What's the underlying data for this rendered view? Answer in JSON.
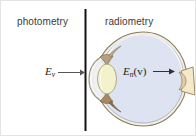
{
  "figure": {
    "width": 196,
    "height": 136,
    "background_color": "#ffffff",
    "border_color": "#e3e3e3"
  },
  "divider": {
    "name": "vertical-divider-line",
    "color": "#111111",
    "x": 84,
    "y_top": 8,
    "y_bottom": 130,
    "thickness": 2
  },
  "labels": {
    "left_side": "photometry",
    "right_side": "radiometry",
    "text_color": "#3b3b3b"
  },
  "quantities": {
    "illuminance": {
      "symbol": "E",
      "subscript": "v",
      "suffix": "",
      "full": "E_v",
      "arrow": "right"
    },
    "spectral_irradiance": {
      "symbol": "E",
      "subscript": "n",
      "suffix": "(v)",
      "full": "E_n(v)",
      "arrow": "right"
    }
  },
  "arrows": {
    "left_arrow_color": "#555555",
    "right_arrow_color": "#333333"
  },
  "eye": {
    "globe_fill": "#dde3f1",
    "globe_stroke": "#9aa3b8",
    "sclera_fill": "#f3efe2",
    "sclera_stroke": "#8e7f66",
    "lens_fill": "#f4f2cd",
    "lens_stroke": "#b5ad7c",
    "iris_fill": "#b8a07c",
    "iris_stroke": "#7d6a4e",
    "cornea_stroke": "#a39782",
    "optic_nerve_fill": "#f6e9c9",
    "optic_nerve_stroke": "#9b8a6b",
    "parts": [
      "cornea",
      "anterior-chamber",
      "iris",
      "lens",
      "vitreous-body",
      "sclera",
      "retina",
      "optic-nerve"
    ]
  }
}
